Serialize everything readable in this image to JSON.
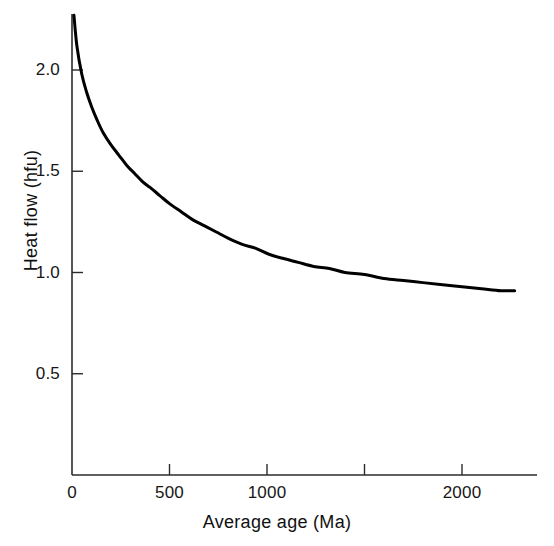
{
  "chart_data": {
    "type": "line",
    "title": "",
    "xlabel": "Average age (Ma)",
    "ylabel": "Heat flow (hfu)",
    "xlim": [
      0,
      2300
    ],
    "ylim": [
      0,
      2.35
    ],
    "grid": false,
    "legend": null,
    "x_ticks": [
      {
        "value": 0,
        "label": "0"
      },
      {
        "value": 500,
        "label": "500"
      },
      {
        "value": 1000,
        "label": "1000"
      },
      {
        "value": 1500,
        "label": ""
      },
      {
        "value": 2000,
        "label": "2000"
      }
    ],
    "y_ticks": [
      {
        "value": 0.5,
        "label": "0.5"
      },
      {
        "value": 1.0,
        "label": "1.0"
      },
      {
        "value": 1.5,
        "label": "1.5"
      },
      {
        "value": 2.0,
        "label": "2.0"
      }
    ],
    "series": [
      {
        "name": "Heat flow decay",
        "color": "#000000",
        "line_width": 3,
        "x": [
          10,
          25,
          50,
          75,
          100,
          130,
          160,
          200,
          240,
          280,
          320,
          360,
          400,
          450,
          500,
          560,
          620,
          680,
          740,
          800,
          870,
          940,
          1010,
          1080,
          1160,
          1240,
          1320,
          1400,
          1500,
          1600,
          1700,
          1800,
          1900,
          2000,
          2100,
          2200,
          2270
        ],
        "y": [
          2.27,
          2.12,
          1.98,
          1.89,
          1.82,
          1.75,
          1.69,
          1.63,
          1.58,
          1.53,
          1.49,
          1.45,
          1.42,
          1.38,
          1.34,
          1.3,
          1.26,
          1.23,
          1.2,
          1.17,
          1.14,
          1.12,
          1.09,
          1.07,
          1.05,
          1.03,
          1.02,
          1.0,
          0.99,
          0.97,
          0.96,
          0.95,
          0.94,
          0.93,
          0.92,
          0.91,
          0.91
        ]
      }
    ]
  },
  "axes": {
    "x_axis_name": "average-age-axis",
    "y_axis_name": "heat-flow-axis"
  }
}
